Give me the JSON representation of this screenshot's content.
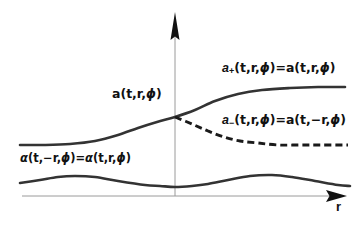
{
  "figure": {
    "background": "#ffffff",
    "axis_color": "#9a9a9a",
    "curve_color": "#333333",
    "arrow_color": "#111111",
    "text_color": "#111111"
  },
  "axes": {
    "x_axis": {
      "name": "horizontal-axis",
      "label": "r",
      "arrow": "right"
    },
    "y_axis": {
      "name": "vertical-axis",
      "label": "",
      "arrow": "up"
    }
  },
  "labels": {
    "a_plus": {
      "text": "a₊(t,r,φ)=a(t,r,φ)",
      "var": "a",
      "sub": "+",
      "lhs_args": "(t,r,φ)",
      "eq": "=",
      "rhs": "a(t,r,φ)"
    },
    "a_minus": {
      "text": "a₋(t,r,φ)=a(t,−r,φ)",
      "var": "a",
      "sub": "−",
      "lhs_args": "(t,r,φ)",
      "eq": "=",
      "rhs": "a(t,−r,φ)"
    },
    "a_center": {
      "text": "a(t,r,φ)"
    },
    "alpha": {
      "text": "α(t,−r,φ)=α(t,r,φ)"
    },
    "r_axis": {
      "text": "r"
    }
  },
  "chart_data": {
    "type": "line",
    "title": "",
    "xlabel": "r",
    "ylabel": "",
    "grid": false,
    "legend": "inline-annotations",
    "origin_px": {
      "x": 175,
      "y": 196
    },
    "series": [
      {
        "name": "a_+(t,r,phi) = a(t,r,phi)",
        "style": "solid",
        "description": "monotonic sigmoid rising left-to-right",
        "points_px": [
          [
            20,
            145
          ],
          [
            45,
            145
          ],
          [
            70,
            144
          ],
          [
            95,
            141
          ],
          [
            118,
            135
          ],
          [
            138,
            128
          ],
          [
            157,
            122
          ],
          [
            175,
            117
          ],
          [
            195,
            110
          ],
          [
            215,
            101
          ],
          [
            238,
            94
          ],
          [
            262,
            90
          ],
          [
            290,
            88
          ],
          [
            318,
            87
          ],
          [
            345,
            87
          ]
        ]
      },
      {
        "name": "a_-(t,r,phi) = a(t,-r,phi)",
        "style": "dashed",
        "dash_px": [
          7,
          4
        ],
        "description": "mirror branch decaying to right plateau from crossing point",
        "points_px": [
          [
            175,
            117
          ],
          [
            192,
            124
          ],
          [
            208,
            131
          ],
          [
            224,
            137
          ],
          [
            240,
            141
          ],
          [
            258,
            143
          ],
          [
            278,
            145
          ],
          [
            300,
            145
          ],
          [
            322,
            145
          ],
          [
            348,
            145
          ]
        ]
      },
      {
        "name": "alpha(t,-r,phi) = alpha(t,r,phi)",
        "style": "solid",
        "description": "even symmetric wave with peaks either side of the axis",
        "points_px": [
          [
            20,
            183
          ],
          [
            40,
            180
          ],
          [
            58,
            177
          ],
          [
            75,
            176
          ],
          [
            95,
            177
          ],
          [
            118,
            181
          ],
          [
            145,
            185
          ],
          [
            160,
            186
          ],
          [
            175,
            187
          ],
          [
            192,
            186
          ],
          [
            208,
            184
          ],
          [
            228,
            180
          ],
          [
            250,
            176
          ],
          [
            272,
            175
          ],
          [
            292,
            177
          ],
          [
            315,
            181
          ],
          [
            338,
            185
          ],
          [
            350,
            186
          ]
        ]
      }
    ],
    "annotations": [
      {
        "text": "a₊(t,r,φ)=a(t,r,φ)",
        "at_px": [
          222,
          62
        ]
      },
      {
        "text": "a₋(t,r,φ)=a(t,−r,φ)",
        "at_px": [
          222,
          114
        ]
      },
      {
        "text": "a(t,r,φ)",
        "at_px": [
          112,
          88
        ]
      },
      {
        "text": "α(t,−r,φ)=α(t,r,φ)",
        "at_px": [
          20,
          153
        ]
      },
      {
        "text": "r",
        "at_px": [
          336,
          200
        ]
      }
    ]
  }
}
